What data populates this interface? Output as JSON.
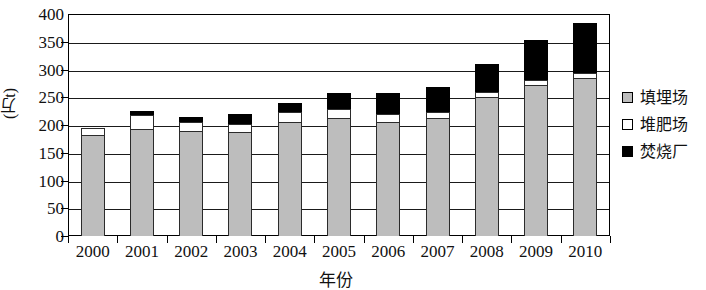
{
  "chart_data": {
    "type": "bar",
    "stacked": true,
    "title": "",
    "xlabel": "年份",
    "ylabel": "(万t)",
    "ylim": [
      0,
      400
    ],
    "ytick_step": 50,
    "yticks": [
      "400",
      "350",
      "300",
      "250",
      "200",
      "150",
      "100",
      "50",
      "0"
    ],
    "grid": "horizontal",
    "legend_position": "right",
    "categories": [
      "2000",
      "2001",
      "2002",
      "2003",
      "2004",
      "2005",
      "2006",
      "2007",
      "2008",
      "2009",
      "2010"
    ],
    "series": [
      {
        "name": "填埋场",
        "color": "#bdbdbd",
        "values": [
          182,
          192,
          189,
          187,
          206,
          212,
          205,
          213,
          251,
          272,
          285
        ]
      },
      {
        "name": "堆肥场",
        "color": "#ffffff",
        "values": [
          13,
          26,
          17,
          15,
          18,
          16,
          14,
          11,
          8,
          10,
          9
        ]
      },
      {
        "name": "焚烧厂",
        "color": "#000000",
        "values": [
          0,
          8,
          9,
          17,
          16,
          30,
          39,
          44,
          51,
          72,
          89
        ]
      }
    ],
    "totals": [
      195,
      226,
      215,
      219,
      240,
      258,
      258,
      268,
      310,
      354,
      383
    ]
  },
  "legend": {
    "items": [
      {
        "label": "填埋场",
        "swatch": "landfill"
      },
      {
        "label": "堆肥场",
        "swatch": "compost"
      },
      {
        "label": "焚烧厂",
        "swatch": "incin"
      }
    ]
  }
}
